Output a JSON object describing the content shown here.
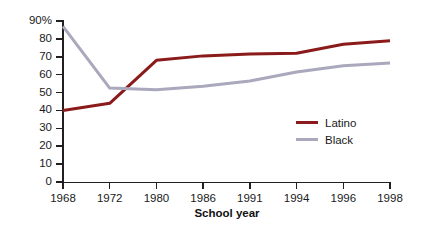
{
  "chart_data": {
    "type": "line",
    "title": "",
    "xlabel": "School year",
    "ylabel": "",
    "categories": [
      "1968",
      "1972",
      "1980",
      "1986",
      "1991",
      "1994",
      "1996",
      "1998"
    ],
    "ylim": [
      0,
      90
    ],
    "grid": false,
    "legend_position": "right-inside",
    "y_ticks": [
      "0",
      "10",
      "20",
      "30",
      "40",
      "50",
      "60",
      "70",
      "80",
      "90%"
    ],
    "y_tick_values": [
      0,
      10,
      20,
      30,
      40,
      50,
      60,
      70,
      80,
      90
    ],
    "series": [
      {
        "name": "Latino",
        "color": "#8b1a1a",
        "values": [
          40,
          44,
          68,
          70.5,
          71.5,
          72,
          77,
          79
        ]
      },
      {
        "name": "Black",
        "color": "#a9a8bd",
        "values": [
          87,
          52.5,
          51.5,
          53.5,
          56.5,
          61.5,
          65,
          66.5
        ]
      }
    ]
  },
  "legend": {
    "items": [
      {
        "label": "Latino",
        "color": "#8b1a1a"
      },
      {
        "label": "Black",
        "color": "#a9a8bd"
      }
    ]
  },
  "axes": {
    "x_title": "School year",
    "axis_color": "#231f20"
  }
}
